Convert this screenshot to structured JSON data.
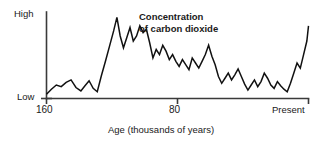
{
  "chart_data": {
    "type": "line",
    "title": "Concentration of carbon dioxide",
    "title_lines": [
      "Concentration",
      "of carbon dioxide"
    ],
    "xlabel": "Age (thousands of years)",
    "ylabel": "",
    "xticks": [
      160,
      80,
      0
    ],
    "xticklabels": [
      "160",
      "80",
      "Present"
    ],
    "yticklabels": [
      "High",
      "Low"
    ],
    "ylim_labels": {
      "low": "Low",
      "high": "High"
    },
    "grid": false,
    "legend": "none",
    "axis_direction": "x decreases left-to-right from 160 thousand years ago to Present",
    "series_name": "Concentration of carbon dioxide",
    "x": [
      160.0,
      157.0,
      154.0,
      151.0,
      148.0,
      145.0,
      142.0,
      139.0,
      136.5,
      134.0,
      131.5,
      129.0,
      126.5,
      124.0,
      121.5,
      119.0,
      117.0,
      115.0,
      113.0,
      111.0,
      109.0,
      107.0,
      105.0,
      103.0,
      101.0,
      99.0,
      97.0,
      95.0,
      93.0,
      91.0,
      89.0,
      87.0,
      85.0,
      83.0,
      81.0,
      79.0,
      77.0,
      75.0,
      73.0,
      71.0,
      69.0,
      67.0,
      65.0,
      63.0,
      61.0,
      59.0,
      57.0,
      55.0,
      53.0,
      51.0,
      49.0,
      47.0,
      45.0,
      43.0,
      41.0,
      39.0,
      37.0,
      35.0,
      33.0,
      31.0,
      29.0,
      27.0,
      25.0,
      23.0,
      21.0,
      19.0,
      17.0,
      15.0,
      13.0,
      11.0,
      9.0,
      7.0,
      5.0,
      3.0,
      1.0,
      0.0
    ],
    "values": [
      5,
      11,
      16,
      14,
      19,
      22,
      13,
      9,
      15,
      21,
      12,
      8,
      27,
      44,
      62,
      80,
      96,
      74,
      60,
      72,
      84,
      68,
      74,
      86,
      78,
      82,
      66,
      48,
      58,
      52,
      63,
      56,
      46,
      52,
      44,
      38,
      46,
      40,
      34,
      48,
      42,
      36,
      44,
      52,
      63,
      50,
      40,
      26,
      18,
      24,
      30,
      22,
      28,
      35,
      26,
      17,
      10,
      16,
      22,
      14,
      20,
      30,
      24,
      16,
      12,
      20,
      15,
      11,
      8,
      18,
      30,
      42,
      36,
      52,
      68,
      86
    ],
    "value_units": "relative scale, Low = 0, High = 100",
    "peak_value": 96,
    "peak_x": 117.0,
    "present_value": 86
  },
  "labels": {
    "y_high": "High",
    "y_low": "Low",
    "x_left": "160",
    "x_mid": "80",
    "x_right": "Present",
    "x_caption": "Age (thousands of years)",
    "title_line1": "Concentration",
    "title_line2": "of carbon dioxide"
  },
  "colors": {
    "line": "#111111",
    "axis": "#3a3a3a",
    "background": "#ffffff",
    "text": "#1a1a1a"
  }
}
